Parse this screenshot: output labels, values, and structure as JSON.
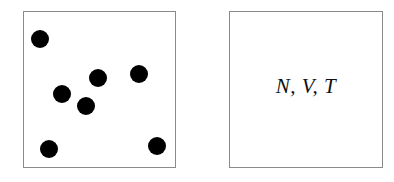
{
  "diagram": {
    "left_panel": {
      "description": "box containing particles",
      "particles": [
        {
          "x": 40,
          "y": 39
        },
        {
          "x": 62,
          "y": 94
        },
        {
          "x": 98,
          "y": 78
        },
        {
          "x": 86,
          "y": 106
        },
        {
          "x": 139,
          "y": 74
        },
        {
          "x": 49,
          "y": 149
        },
        {
          "x": 157,
          "y": 146
        }
      ],
      "particle_count": 7
    },
    "right_panel": {
      "label": "N, V, T"
    },
    "colors": {
      "border": "#8a8a8a",
      "particle": "#000000",
      "text": "#111111"
    }
  }
}
